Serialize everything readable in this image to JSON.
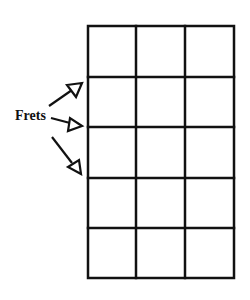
{
  "diagram": {
    "label": "Frets",
    "grid": {
      "columns": 3,
      "rows": 5,
      "x_lines": [
        88,
        136,
        185,
        234
      ],
      "y_lines": [
        26,
        77,
        127,
        178,
        228,
        278
      ]
    },
    "arrows": [
      {
        "from": [
          49,
          106
        ],
        "to": [
          82,
          83
        ]
      },
      {
        "from": [
          51,
          118
        ],
        "to": [
          82,
          126
        ]
      },
      {
        "from": [
          52,
          137
        ],
        "to": [
          81,
          174
        ]
      }
    ],
    "colors": {
      "line": "#111111",
      "background": "#ffffff"
    }
  }
}
